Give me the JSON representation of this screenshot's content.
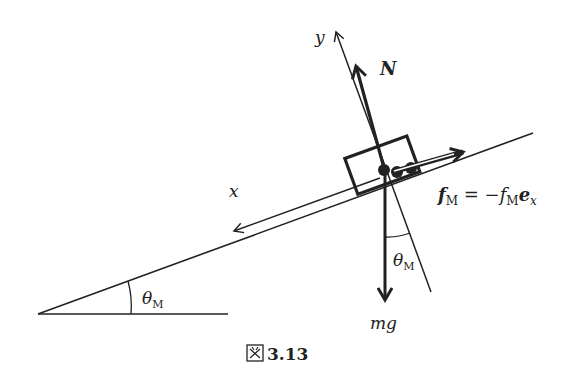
{
  "figure": {
    "caption": "図 3.13",
    "caption_prefix": "図",
    "caption_number": "3.13"
  },
  "labels": {
    "y_axis": "y",
    "x_axis": "x",
    "normal_force": "N",
    "friction_lhs": "f",
    "friction_lhs_sub": "M",
    "friction_eq": " = −",
    "friction_rhs_f": "f",
    "friction_rhs_sub": "M",
    "friction_rhs_e": "e",
    "friction_rhs_esub": "x",
    "gravity": "mg",
    "angle_base": "θ",
    "angle_base_sub": "M",
    "angle_vertical": "θ",
    "angle_vertical_sub": "M"
  },
  "colors": {
    "ink": "#222222",
    "background": "#ffffff"
  }
}
